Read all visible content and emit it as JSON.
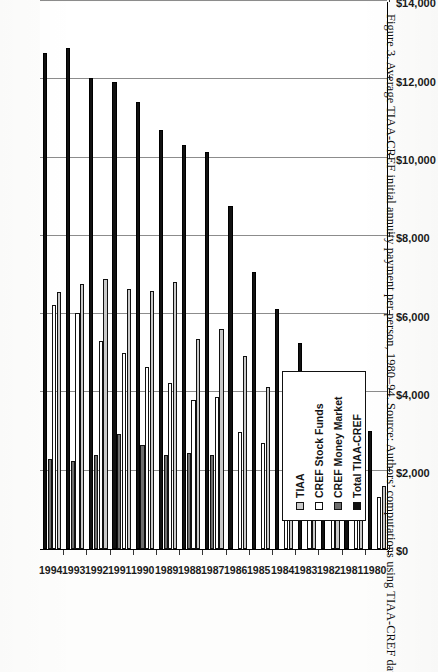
{
  "figure": {
    "caption": "Figure 3. Average TIAA-CREF initial annuity payment per person, 1980–94. Source: Authors’ computations using TIAA-CREF data."
  },
  "legend": {
    "position": "inside-lower-left",
    "entries": [
      {
        "label": "TIAA",
        "key": "tiaa",
        "color": "#c9c9c9"
      },
      {
        "label": "CREF Stock Funds",
        "key": "stock",
        "color": "#ffffff"
      },
      {
        "label": "CREF Money Market",
        "key": "money",
        "color": "#6e6e6e"
      },
      {
        "label": "Total TIAA-CREF",
        "key": "total",
        "color": "#111111"
      }
    ]
  },
  "axis": {
    "value_ticks": [
      "$0",
      "$2,000",
      "$4,000",
      "$6,000",
      "$8,000",
      "$10,000",
      "$12,000",
      "$14,000"
    ],
    "value_tick_numbers": [
      0,
      2000,
      4000,
      6000,
      8000,
      10000,
      12000,
      14000
    ]
  },
  "chart_data": {
    "type": "bar",
    "orientation": "horizontal-rotated",
    "title": "",
    "xlabel": "",
    "ylabel": "",
    "grid": true,
    "legend_position": "inside-lower-left",
    "ylim": [
      0,
      14000
    ],
    "categories": [
      "1980",
      "1981",
      "1982",
      "1983",
      "1984",
      "1985",
      "1986",
      "1987",
      "1988",
      "1989",
      "1990",
      "1991",
      "1992",
      "1993",
      "1994"
    ],
    "series": [
      {
        "name": "TIAA",
        "key": "tiaa",
        "color": "#c9c9c9",
        "values": [
          1600,
          2120,
          2180,
          2950,
          3480,
          4150,
          4920,
          5620,
          5370,
          6820,
          6600,
          6640,
          6900,
          6780,
          6560
        ]
      },
      {
        "name": "CREF Stock Funds",
        "key": "stock",
        "color": "#ffffff",
        "values": [
          1320,
          1620,
          1560,
          2230,
          2380,
          2700,
          3000,
          3880,
          3800,
          4230,
          4660,
          5010,
          5320,
          6030,
          6240
        ]
      },
      {
        "name": "CREF Money Market",
        "key": "money",
        "color": "#6e6e6e",
        "values": [
          0,
          0,
          0,
          0,
          0,
          0,
          0,
          2400,
          2440,
          2400,
          2660,
          2930,
          2400,
          2260,
          2310
        ]
      },
      {
        "name": "Total TIAA-CREF",
        "key": "total",
        "color": "#111111",
        "values": [
          3020,
          4180,
          4460,
          5260,
          6120,
          7080,
          8770,
          10140,
          10330,
          10700,
          11410,
          11940,
          12030,
          12790,
          12680
        ]
      }
    ]
  }
}
